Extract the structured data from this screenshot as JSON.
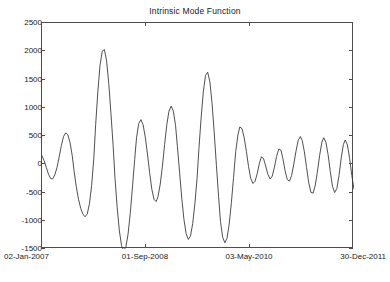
{
  "chart_data": {
    "type": "line",
    "title": "Intrinsic Mode Function",
    "xlabel": "",
    "ylabel": "",
    "grid": false,
    "legend": null,
    "line_color": "#3c3c3c",
    "background_color": "#ffffff",
    "axis_color": "#4d4d4d",
    "ylim": [
      -1500,
      2500
    ],
    "ytick_labels": [
      "2500",
      "2000",
      "1500",
      "1000",
      "500",
      "0",
      "-500",
      "-1000",
      "-1500"
    ],
    "ytick_values": [
      2500,
      2000,
      1500,
      1000,
      500,
      0,
      -500,
      -1000,
      -1500
    ],
    "xtick_labels": [
      "02-Jan-2007",
      "01-Sep-2008",
      "03-May-2010",
      "30-Dec-2011"
    ],
    "xtick_positions": [
      0,
      0.3333,
      0.6667,
      1.0
    ],
    "xlim_labels": [
      "02-Jan-2007",
      "30-Dec-2011"
    ],
    "x": [
      0.0,
      0.007,
      0.014,
      0.021,
      0.028,
      0.034,
      0.041,
      0.048,
      0.055,
      0.062,
      0.069,
      0.076,
      0.083,
      0.09,
      0.097,
      0.103,
      0.11,
      0.117,
      0.124,
      0.131,
      0.138,
      0.145,
      0.152,
      0.159,
      0.166,
      0.172,
      0.179,
      0.186,
      0.193,
      0.2,
      0.207,
      0.214,
      0.221,
      0.228,
      0.234,
      0.241,
      0.248,
      0.255,
      0.262,
      0.269,
      0.276,
      0.283,
      0.29,
      0.297,
      0.303,
      0.31,
      0.317,
      0.324,
      0.331,
      0.338,
      0.345,
      0.352,
      0.359,
      0.366,
      0.372,
      0.379,
      0.386,
      0.393,
      0.4,
      0.407,
      0.414,
      0.421,
      0.428,
      0.434,
      0.441,
      0.448,
      0.455,
      0.462,
      0.469,
      0.476,
      0.483,
      0.49,
      0.497,
      0.503,
      0.51,
      0.517,
      0.524,
      0.531,
      0.538,
      0.545,
      0.552,
      0.559,
      0.566,
      0.572,
      0.579,
      0.586,
      0.593,
      0.6,
      0.607,
      0.614,
      0.621,
      0.628,
      0.634,
      0.641,
      0.648,
      0.655,
      0.662,
      0.669,
      0.676,
      0.683,
      0.69,
      0.697,
      0.703,
      0.71,
      0.717,
      0.724,
      0.731,
      0.738,
      0.745,
      0.752,
      0.759,
      0.766,
      0.772,
      0.779,
      0.786,
      0.793,
      0.8,
      0.807,
      0.814,
      0.821,
      0.828,
      0.834,
      0.841,
      0.848,
      0.855,
      0.862,
      0.869,
      0.876,
      0.883,
      0.89,
      0.897,
      0.903,
      0.91,
      0.917,
      0.924,
      0.931,
      0.938,
      0.945,
      0.952,
      0.959,
      0.966,
      0.972,
      0.979,
      0.986,
      0.993,
      1.0
    ],
    "y": [
      150,
      60,
      -60,
      -180,
      -255,
      -260,
      -190,
      -60,
      130,
      330,
      490,
      555,
      520,
      380,
      150,
      -130,
      -400,
      -620,
      -780,
      -880,
      -930,
      -880,
      -700,
      -380,
      100,
      700,
      1290,
      1750,
      2000,
      2030,
      1830,
      1430,
      900,
      330,
      -250,
      -770,
      -1180,
      -1440,
      -1530,
      -1460,
      -1230,
      -860,
      -400,
      80,
      470,
      720,
      790,
      700,
      480,
      180,
      -150,
      -440,
      -620,
      -660,
      -570,
      -350,
      -30,
      350,
      700,
      940,
      1030,
      940,
      690,
      310,
      -140,
      -600,
      -980,
      -1230,
      -1330,
      -1270,
      -1050,
      -700,
      -250,
      280,
      820,
      1280,
      1570,
      1630,
      1460,
      1080,
      560,
      -20,
      -570,
      -1010,
      -1290,
      -1390,
      -1310,
      -1060,
      -680,
      -230,
      230,
      520,
      660,
      630,
      470,
      230,
      -40,
      -250,
      -340,
      -300,
      -160,
      20,
      130,
      100,
      -30,
      -180,
      -260,
      -210,
      -50,
      140,
      270,
      250,
      100,
      -110,
      -270,
      -300,
      -200,
      0,
      230,
      420,
      490,
      420,
      220,
      -60,
      -330,
      -500,
      -510,
      -370,
      -120,
      160,
      390,
      470,
      390,
      170,
      -130,
      -390,
      -500,
      -430,
      -200,
      110,
      350,
      430,
      340,
      100,
      -200,
      -440,
      -530,
      -440,
      -170,
      230,
      600
    ]
  }
}
